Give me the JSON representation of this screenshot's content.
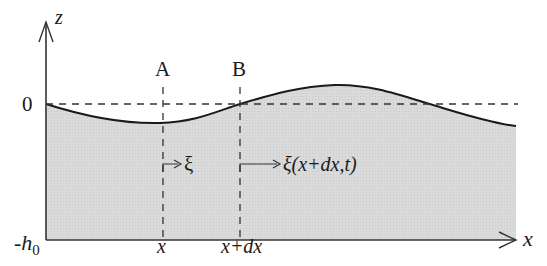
{
  "diagram": {
    "axes": {
      "z_label": "z",
      "x_label": "x",
      "zero_label": "0",
      "depth_label_main": "-h",
      "depth_label_sub": "0"
    },
    "sections": [
      {
        "label": "A",
        "position_label": "x",
        "displacement_label": "ξ"
      },
      {
        "label": "B",
        "position_label": "x+dx",
        "displacement_label": "ξ(x+dx,t)"
      }
    ],
    "colors": {
      "fill": "#d9d9d9",
      "line": "#1a1a1a",
      "dash": "#333333"
    }
  }
}
